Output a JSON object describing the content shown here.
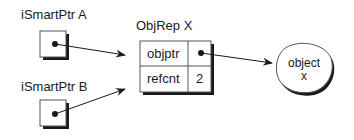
{
  "diagram": {
    "pointers": [
      {
        "label": "iSmartPtr A"
      },
      {
        "label": "iSmartPtr B"
      }
    ],
    "objrep": {
      "title": "ObjRep X",
      "rows": [
        {
          "field": "objptr",
          "value": ""
        },
        {
          "field": "refcnt",
          "value": "2"
        }
      ]
    },
    "object": {
      "line1": "object",
      "line2": "x"
    }
  }
}
